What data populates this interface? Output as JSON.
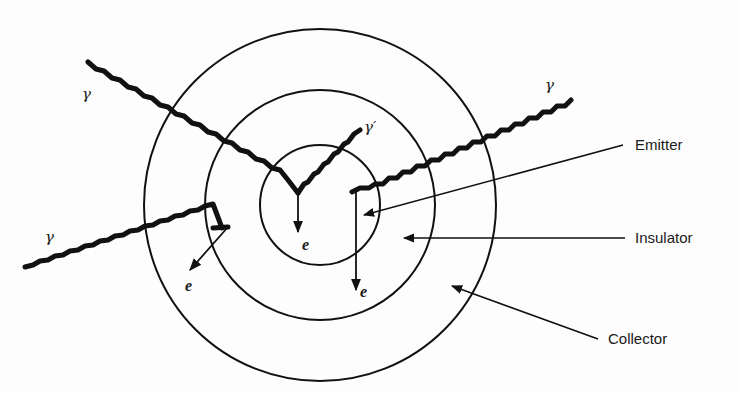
{
  "diagram": {
    "title": "",
    "components": [
      {
        "id": "emitter",
        "label": "Emitter"
      },
      {
        "id": "insulator",
        "label": "Insulator"
      },
      {
        "id": "collector",
        "label": "Collector"
      }
    ],
    "particles": {
      "gamma": "γ",
      "gamma_prime": "γ′",
      "electron": "e"
    },
    "rings": [
      {
        "name": "emitter-ring",
        "cx": 320,
        "cy": 205,
        "r": 60
      },
      {
        "name": "insulator-ring",
        "cx": 320,
        "cy": 205,
        "r": 115
      },
      {
        "name": "collector-ring",
        "cx": 320,
        "cy": 205,
        "r": 176
      }
    ],
    "colors": {
      "ink": "#111111",
      "background": "#fdfdfd"
    }
  }
}
